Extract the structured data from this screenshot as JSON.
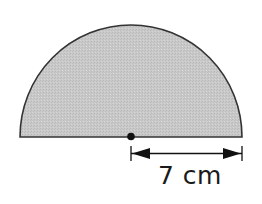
{
  "diagram": {
    "shape": "semicircle",
    "fill_color": "#c9c9c9",
    "stroke_color": "#333333",
    "center_point": "dot",
    "dimension": {
      "label": "7 cm",
      "measures": "radius"
    }
  }
}
